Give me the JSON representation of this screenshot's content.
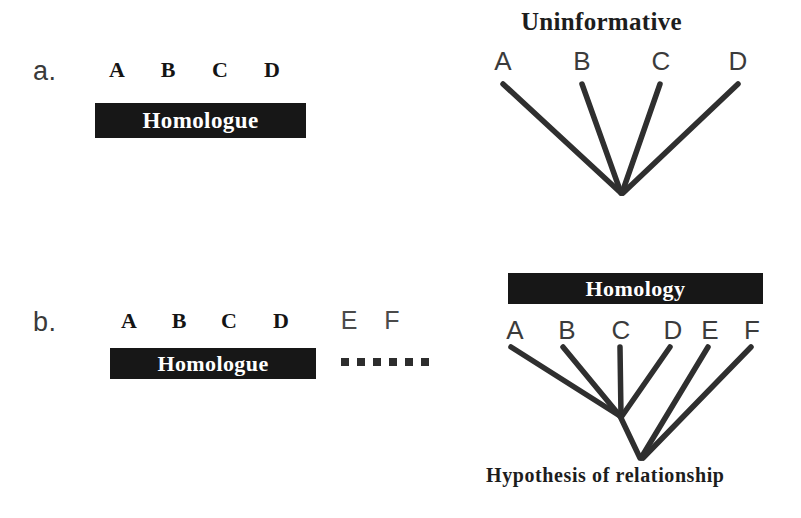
{
  "figure": {
    "background_color": "#ffffff",
    "ink_color": "#1a1a1a",
    "bar_color": "#171717",
    "bar_text_color": "#ffffff",
    "branch_color": "#2f2f2f"
  },
  "panel_a": {
    "letter": "a.",
    "taxa": [
      "A",
      "B",
      "C",
      "D"
    ],
    "bar_label": "Homologue",
    "tree": {
      "title": "Uninformative",
      "tips": [
        "A",
        "B",
        "C",
        "D"
      ],
      "caption": ""
    }
  },
  "panel_b": {
    "letter": "b.",
    "taxa_homologous": [
      "A",
      "B",
      "C",
      "D"
    ],
    "taxa_outside": [
      "E",
      "F"
    ],
    "bar_label": "Homologue",
    "dot_count": 6,
    "tree": {
      "bar_label": "Homology",
      "tips": [
        "A",
        "B",
        "C",
        "D",
        "E",
        "F"
      ],
      "caption": "Hypothesis of relationship"
    }
  }
}
